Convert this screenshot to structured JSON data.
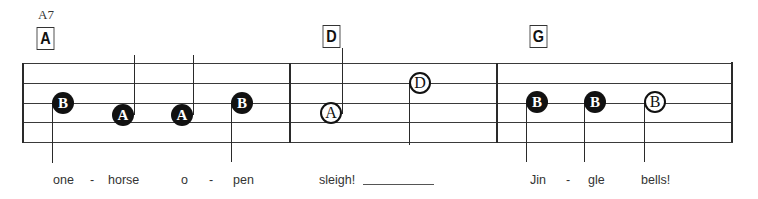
{
  "chords": [
    {
      "name": "A7",
      "box": "A"
    },
    {
      "box": "D"
    },
    {
      "box": "G"
    }
  ],
  "notes": [
    {
      "letter": "B",
      "style": "filled"
    },
    {
      "letter": "A",
      "style": "filled"
    },
    {
      "letter": "A",
      "style": "filled"
    },
    {
      "letter": "B",
      "style": "filled"
    },
    {
      "letter": "A",
      "style": "open"
    },
    {
      "letter": "D",
      "style": "open"
    },
    {
      "letter": "B",
      "style": "filled"
    },
    {
      "letter": "B",
      "style": "filled"
    },
    {
      "letter": "B",
      "style": "open"
    }
  ],
  "lyrics": [
    "one",
    "-",
    "horse",
    "o",
    "-",
    "pen",
    "sleigh!",
    "Jin",
    "-",
    "gle",
    "bells!"
  ],
  "colors": {
    "ink": "#111111",
    "staff": "#3a3a3a",
    "background": "#ffffff"
  }
}
